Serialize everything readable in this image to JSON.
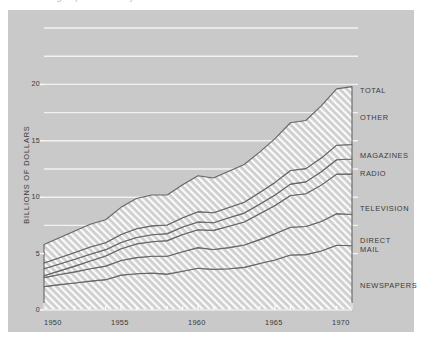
{
  "figure": {
    "background_color": "#c9c9c9",
    "page_color": "#ffffff",
    "cropped_caption": "advertising expenditures by media"
  },
  "axes": {
    "y_title": "BILLIONS OF DOLLARS",
    "y_ticks": [
      "0",
      "5",
      "10",
      "15",
      "20"
    ],
    "x_ticks": [
      "1950",
      "1955",
      "1960",
      "1965",
      "1970"
    ]
  },
  "series_labels": [
    {
      "name": "total-label",
      "text": "TOTAL"
    },
    {
      "name": "other-label",
      "text": "OTHER"
    },
    {
      "name": "magazines-label",
      "text": "MAGAZINES"
    },
    {
      "name": "radio-label",
      "text": "RADIO"
    },
    {
      "name": "television-label",
      "text": "TELEVISION"
    },
    {
      "name": "direct-mail-label-1",
      "text": "DIRECT"
    },
    {
      "name": "direct-mail-label-2",
      "text": "MAIL"
    },
    {
      "name": "newspapers-label",
      "text": "NEWSPAPERS"
    }
  ],
  "chart_data": {
    "type": "area",
    "title": "",
    "subtitle": "",
    "xlabel": "",
    "ylabel": "BILLIONS OF DOLLARS",
    "xlim": [
      1950,
      1970
    ],
    "ylim": [
      0,
      21.5
    ],
    "ytick_values": [
      0,
      5,
      10,
      15,
      20
    ],
    "gridlines": [
      5,
      7.5,
      10,
      12.5,
      15,
      17.5,
      20,
      22.5,
      25
    ],
    "grid": true,
    "legend_position": "right-of-plot-inline",
    "stacked": true,
    "hatch": "diagonal-forward-slash",
    "x": [
      1950,
      1951,
      1952,
      1953,
      1954,
      1955,
      1956,
      1957,
      1958,
      1959,
      1960,
      1961,
      1962,
      1963,
      1964,
      1965,
      1966,
      1967,
      1968,
      1969,
      1970
    ],
    "series": [
      {
        "name": "NEWSPAPERS",
        "values": [
          2.07,
          2.25,
          2.39,
          2.56,
          2.69,
          3.09,
          3.22,
          3.27,
          3.18,
          3.43,
          3.7,
          3.6,
          3.66,
          3.78,
          4.12,
          4.43,
          4.87,
          4.91,
          5.23,
          5.74,
          5.7
        ]
      },
      {
        "name": "DIRECT MAIL",
        "values": [
          0.8,
          0.89,
          0.99,
          1.09,
          1.2,
          1.3,
          1.42,
          1.49,
          1.59,
          1.73,
          1.83,
          1.77,
          1.87,
          1.98,
          2.12,
          2.32,
          2.46,
          2.49,
          2.61,
          2.8,
          2.77
        ]
      },
      {
        "name": "TELEVISION",
        "values": [
          0.17,
          0.33,
          0.51,
          0.69,
          0.9,
          1.04,
          1.22,
          1.29,
          1.38,
          1.53,
          1.59,
          1.69,
          1.9,
          2.04,
          2.29,
          2.52,
          2.82,
          2.91,
          3.23,
          3.51,
          3.6
        ]
      },
      {
        "name": "RADIO",
        "values": [
          0.61,
          0.61,
          0.61,
          0.61,
          0.56,
          0.55,
          0.57,
          0.62,
          0.62,
          0.66,
          0.69,
          0.68,
          0.74,
          0.79,
          0.85,
          0.92,
          1.01,
          1.05,
          1.19,
          1.27,
          1.31
        ]
      },
      {
        "name": "MAGAZINES",
        "values": [
          0.52,
          0.55,
          0.59,
          0.63,
          0.61,
          0.72,
          0.77,
          0.79,
          0.77,
          0.83,
          0.91,
          0.88,
          0.92,
          0.96,
          1.03,
          1.12,
          1.21,
          1.17,
          1.21,
          1.29,
          1.29
        ]
      },
      {
        "name": "OTHER",
        "values": [
          1.63,
          1.77,
          1.91,
          2.02,
          2.04,
          2.4,
          2.68,
          2.74,
          2.66,
          2.92,
          3.18,
          3.08,
          3.21,
          3.35,
          3.59,
          3.89,
          4.23,
          4.27,
          4.63,
          4.99,
          5.13
        ]
      }
    ],
    "total_label": "TOTAL",
    "totals": [
      5.8,
      6.4,
      7.0,
      7.6,
      8.0,
      9.1,
      9.88,
      10.2,
      10.2,
      11.1,
      11.9,
      11.7,
      12.3,
      12.9,
      14.0,
      15.2,
      16.6,
      16.8,
      18.1,
      19.6,
      19.8
    ]
  }
}
